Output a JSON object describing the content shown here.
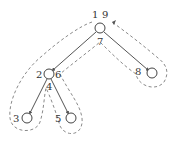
{
  "diagram": {
    "colors": {
      "edge": "#555555",
      "tour": "#8a8a8a",
      "node_stroke": "#444444",
      "text": "#333333"
    },
    "nodes": [
      {
        "id": "root",
        "cx": 100,
        "cy": 28,
        "labels": [
          "1",
          "9",
          "7"
        ]
      },
      {
        "id": "left",
        "cx": 49,
        "cy": 74,
        "labels": [
          "2",
          "6",
          "4"
        ]
      },
      {
        "id": "right",
        "cx": 152,
        "cy": 73,
        "labels": [
          "8"
        ]
      },
      {
        "id": "leaf-a",
        "cx": 27,
        "cy": 118,
        "labels": [
          "3"
        ]
      },
      {
        "id": "leaf-b",
        "cx": 71,
        "cy": 118,
        "labels": [
          "5"
        ]
      }
    ],
    "edges": [
      [
        "root",
        "left"
      ],
      [
        "root",
        "right"
      ],
      [
        "left",
        "leaf-a"
      ],
      [
        "left",
        "leaf-b"
      ]
    ],
    "visit_labels": {
      "root_pre": "1",
      "root_post": "9",
      "root_mid": "7",
      "left_pre": "2",
      "left_post": "6",
      "left_mid": "4",
      "right_leaf": "8",
      "leaf_a": "3",
      "leaf_b": "5"
    }
  }
}
